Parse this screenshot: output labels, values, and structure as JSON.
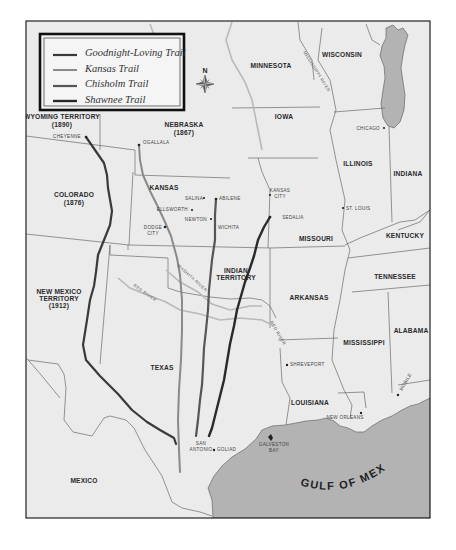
{
  "legend": {
    "items": [
      {
        "label": "Goodnight-Loving Trail",
        "color": "#3a3a3a"
      },
      {
        "label": "Kansas Trail",
        "color": "#8a8a8a"
      },
      {
        "label": "Chisholm Trail",
        "color": "#555555"
      },
      {
        "label": "Shawnee Trail",
        "color": "#2a2a2a"
      }
    ],
    "compass_label": "N"
  },
  "regions": {
    "wyoming": {
      "name": "WYOMING TERRITORY",
      "year": "(1890)"
    },
    "nebraska": {
      "name": "NEBRASKA",
      "year": "(1867)"
    },
    "colorado": {
      "name": "COLORADO",
      "year": "(1876)"
    },
    "new_mexico": {
      "name1": "NEW MEXICO",
      "name2": "TERRITORY",
      "year": "(1912)"
    },
    "kansas": "KANSAS",
    "indian_territory": {
      "line1": "INDIAN",
      "line2": "TERRITORY"
    },
    "texas": "TEXAS",
    "mexico": "MEXICO",
    "minnesota": "MINNESOTA",
    "wisconsin": "WISCONSIN",
    "iowa": "IOWA",
    "illinois": "ILLINOIS",
    "indiana": "INDIANA",
    "missouri": "MISSOURI",
    "kentucky": "KENTUCKY",
    "tennessee": "TENNESSEE",
    "arkansas": "ARKANSAS",
    "mississippi": "MISSISSIPPI",
    "alabama": "ALABAMA",
    "louisiana": "LOUISIANA"
  },
  "cities": {
    "cheyenne": "CHEYENNE",
    "ogallala": "OGALLALA",
    "salina": "SALINA",
    "abilene": "ABILENE",
    "ellsworth": "ELLSWORTH",
    "newton": "NEWTON",
    "wichita": "WICHITA",
    "dodge1": "DODGE",
    "dodge2": "CITY",
    "kansas_city1": "KANSAS",
    "kansas_city2": "CITY",
    "sedalia": "SEDALIA",
    "st_louis": "ST. LOUIS",
    "chicago": "CHICAGO",
    "shreveport": "SHREVEPORT",
    "new_orleans": "NEW ORLEANS",
    "mobile": "MOBILE",
    "san_antonio1": "SAN",
    "san_antonio2": "ANTONIO",
    "goliad": "GOLIAD",
    "galveston1": "GALVESTON",
    "galveston2": "BAY"
  },
  "water": {
    "gulf": "GULF OF MEXICO",
    "mississippi_river": "MISSISSIPPI RIVER",
    "red_river_west": "RED RIVER",
    "red_river_east": "RED RIVER",
    "washita_river": "WASHITA RIVER"
  },
  "colors": {
    "land": "#ebebeb",
    "water": "#b3b3b3",
    "frame": "#222222",
    "border": "#6a6a6a"
  }
}
